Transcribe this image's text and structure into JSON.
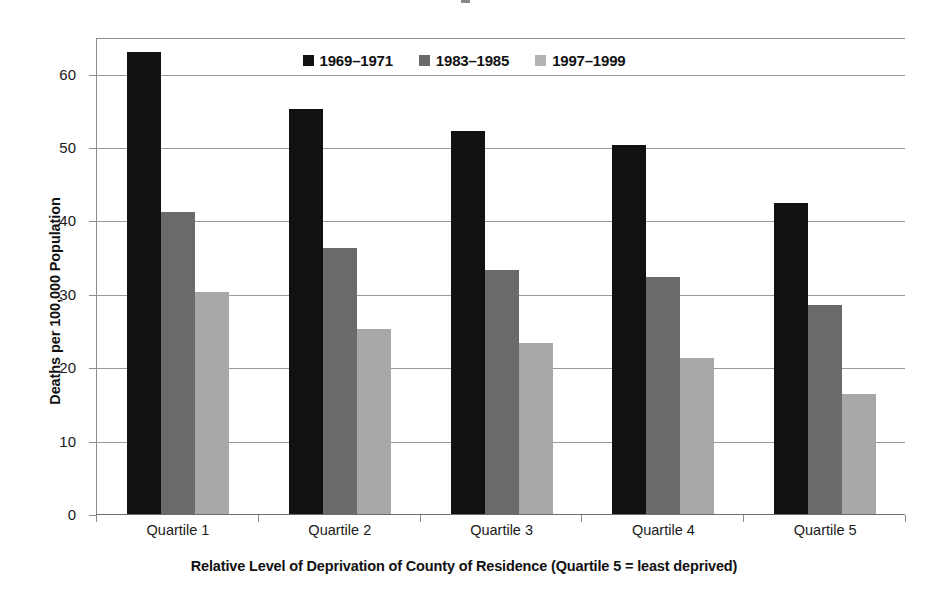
{
  "chart_data": {
    "type": "bar",
    "title": "",
    "xlabel": "Relative Level of Deprivation of County of Residence (Quartile 5 = least deprived)",
    "ylabel": "Deaths per 100,000 Population",
    "categories": [
      "Quartile 1",
      "Quartile 2",
      "Quartile 3",
      "Quartile 4",
      "Quartile 5"
    ],
    "series": [
      {
        "name": "1969–1971",
        "color": "#111111",
        "values": [
          63.0,
          55.2,
          52.2,
          50.3,
          42.4
        ]
      },
      {
        "name": "1983–1985",
        "color": "#6a6a6a",
        "values": [
          41.1,
          36.2,
          33.3,
          32.3,
          28.5
        ]
      },
      {
        "name": "1997–1999",
        "color": "#a8a8a8",
        "values": [
          30.2,
          25.2,
          23.3,
          21.3,
          16.4
        ]
      }
    ],
    "ylim": [
      0,
      65
    ],
    "yticks": [
      0,
      10,
      20,
      30,
      40,
      50,
      60
    ],
    "ytick_labels": [
      "0",
      "10",
      "20",
      "30",
      "40",
      "50",
      "60"
    ],
    "grid": true,
    "grid_axis": "y",
    "legend_position": "top-center"
  },
  "colors": {
    "series_1969_1971": "#111111",
    "series_1983_1985": "#6a6a6a",
    "series_1997_1999": "#a8a8a8",
    "axis": "#8c8c8c",
    "gridline": "#9a9a9a",
    "background": "#ffffff",
    "text": "#1a1a1a"
  }
}
